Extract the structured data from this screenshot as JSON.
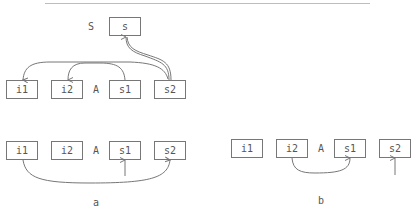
{
  "diagram": {
    "top": {
      "stack_label": "S",
      "stack_box": "s",
      "array_label": "A",
      "boxes": [
        "i1",
        "i2",
        "s1",
        "s2"
      ]
    },
    "panel_a": {
      "caption": "a",
      "array_label": "A",
      "boxes": [
        "i1",
        "i2",
        "s1",
        "s2"
      ]
    },
    "panel_b": {
      "caption": "b",
      "array_label": "A",
      "boxes": [
        "i1",
        "i2",
        "s1",
        "s2"
      ]
    },
    "colors": {
      "stroke": "#777777",
      "text": "#555555",
      "rule": "#bdbdbd"
    }
  }
}
